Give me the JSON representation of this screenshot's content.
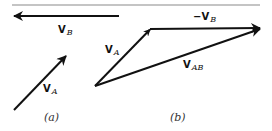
{
  "figure": {
    "panels": [
      {
        "caption": "(a)",
        "vectors": [
          {
            "name": "V",
            "subscript": "B",
            "from": [
              119,
              16
            ],
            "to": [
              12,
              16
            ]
          },
          {
            "name": "V",
            "subscript": "A",
            "from": [
              14,
              110
            ],
            "to": [
              67,
              55
            ]
          }
        ]
      },
      {
        "caption": "(b)",
        "vectors": [
          {
            "name": "V",
            "subscript": "A",
            "from": [
              95,
              86
            ],
            "to": [
              150,
              29
            ]
          },
          {
            "name": "−V",
            "subscript": "B",
            "from": [
              150,
              29
            ],
            "to": [
              262,
              28
            ]
          },
          {
            "name": "V",
            "subscript": "AB",
            "from": [
              95,
              86
            ],
            "to": [
              262,
              28
            ]
          }
        ]
      }
    ],
    "labels": {
      "a_vb_main": "V",
      "a_vb_sub": "B",
      "a_va_main": "V",
      "a_va_sub": "A",
      "b_va_main": "V",
      "b_va_sub": "A",
      "b_neg_vb_main": "−V",
      "b_neg_vb_sub": "B",
      "b_vab_main": "V",
      "b_vab_sub": "AB",
      "caption_a": "(a)",
      "caption_b": "(b)"
    },
    "colors": {
      "stroke": "#111111",
      "rule": "#888888"
    }
  }
}
